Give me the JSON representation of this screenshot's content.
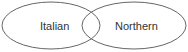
{
  "diagram": {
    "type": "venn",
    "sets": [
      {
        "id": "left",
        "label": "Italian",
        "cx": 51,
        "cy": 25.5,
        "rx": 49,
        "ry": 23.5
      },
      {
        "id": "right",
        "label": "Northern",
        "cx": 134,
        "cy": 25.5,
        "rx": 52,
        "ry": 23.5
      }
    ],
    "stroke_color": "#666666",
    "text_color": "#333333"
  }
}
